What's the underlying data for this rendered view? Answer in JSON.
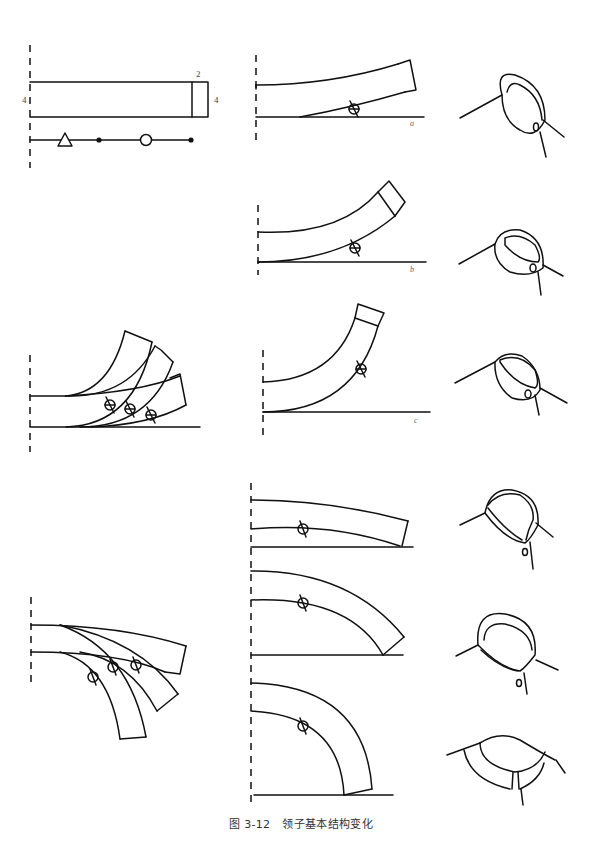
{
  "figure": {
    "caption_number": "图 3-12",
    "caption_title": "领子基本结构变化",
    "line_color": "#111111",
    "background": "#ffffff"
  },
  "base_pattern": {
    "dimension_left": "4",
    "dimension_top_right": "2",
    "dimension_right": "4",
    "legend_symbols": [
      "triangle",
      "dot",
      "circle",
      "dot"
    ]
  },
  "variants": [
    {
      "label": "a",
      "description": "slightly curved collar pattern"
    },
    {
      "label": "b",
      "description": "moderately curved collar pattern"
    },
    {
      "label": "c",
      "description": "strongly curved collar pattern"
    }
  ],
  "overlay_groups": [
    {
      "name": "upward-curve-overlay",
      "count": 3
    },
    {
      "name": "downward-curve-overlay",
      "count": 3
    }
  ],
  "flat_collar_patterns": [
    {
      "name": "flat-collar-pattern-1"
    },
    {
      "name": "flat-collar-pattern-2"
    },
    {
      "name": "flat-collar-pattern-3"
    }
  ],
  "collar_sketches": [
    {
      "name": "stand-collar-sketch-a"
    },
    {
      "name": "stand-collar-sketch-b"
    },
    {
      "name": "stand-collar-sketch-c"
    },
    {
      "name": "shirt-collar-sketch-1"
    },
    {
      "name": "shirt-collar-sketch-2"
    },
    {
      "name": "flat-collar-sketch"
    }
  ]
}
